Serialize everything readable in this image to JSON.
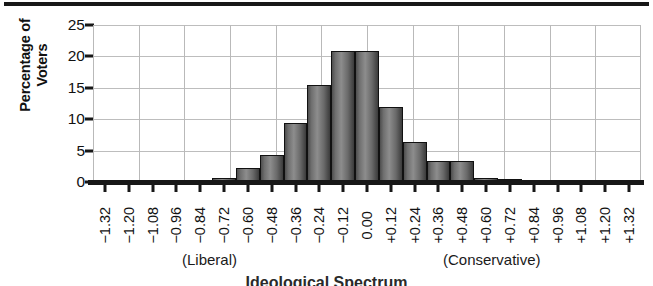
{
  "chart_data": {
    "type": "bar",
    "title": "",
    "subtitle": "",
    "xlabel": "Ideological Spectrum",
    "ylabel": "Percentage of Voters",
    "ylim": [
      0,
      25
    ],
    "yticks": [
      "0",
      "5",
      "10",
      "15",
      "20",
      "25"
    ],
    "ytick_values": [
      0,
      5,
      10,
      15,
      20,
      25
    ],
    "grid": true,
    "legend": null,
    "categories": [
      "−1.32",
      "−1.20",
      "−1.08",
      "−0.96",
      "−0.84",
      "−0.72",
      "−0.60",
      "−0.48",
      "−0.36",
      "−0.24",
      "−0.12",
      "0.00",
      "+0.12",
      "+0.24",
      "+0.36",
      "+0.48",
      "+0.60",
      "+0.72",
      "+0.84",
      "+0.96",
      "+1.08",
      "+1.20",
      "+1.32"
    ],
    "values": [
      0.0,
      0.0,
      0.0,
      0.0,
      0.0,
      0.7,
      2.3,
      4.3,
      9.4,
      15.4,
      20.8,
      20.8,
      12.0,
      6.3,
      3.4,
      3.3,
      0.6,
      0.5,
      0.0,
      0.0,
      0.0,
      0.0,
      0.0
    ],
    "annotations": [
      {
        "text": "(Liberal)",
        "near_category": "−0.84"
      },
      {
        "text": "(Conservative)",
        "near_category": "+0.48"
      }
    ]
  },
  "axes": {
    "y_title_line1": "Percentage of",
    "y_title_line2": "Voters"
  },
  "captions": {
    "liberal": "(Liberal)",
    "conservative": "(Conservative)",
    "x_axis_title": "Ideological Spectrum"
  },
  "colors": {
    "bar_fill_light": "#8d8d8d",
    "bar_fill_dark": "#3b3b3b",
    "bar_outline": "#111111",
    "grid": "#b9b9b9",
    "axis": "#171717",
    "text": "#1a1a1a",
    "background": "#ffffff"
  }
}
